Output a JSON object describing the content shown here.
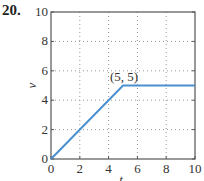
{
  "problem_number": "20.",
  "chart_data": {
    "type": "line",
    "title": "",
    "xlabel": "t",
    "ylabel": "v",
    "xlim": [
      0,
      10
    ],
    "ylim": [
      0,
      10
    ],
    "xticks": [
      0,
      2,
      4,
      6,
      8,
      10
    ],
    "yticks": [
      0,
      2,
      4,
      6,
      8,
      10
    ],
    "grid": true,
    "grid_style": "dotted",
    "series": [
      {
        "name": "v(t)",
        "color": "#4a90d0",
        "x": [
          0,
          5,
          10
        ],
        "y": [
          0,
          5,
          5
        ]
      }
    ],
    "annotations": [
      {
        "text": "(5, 5)",
        "x": 5,
        "y": 5
      }
    ]
  }
}
